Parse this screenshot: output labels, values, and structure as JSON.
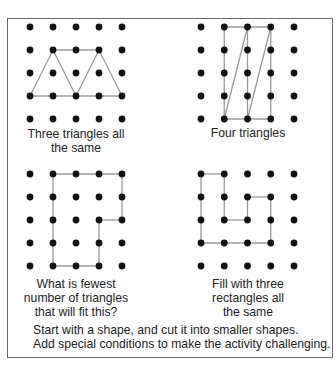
{
  "panels": [
    {
      "id": "three-triangles",
      "caption_lines": [
        "Three triangles all",
        "the same"
      ],
      "grid": {
        "origin_x": 30,
        "origin_y": 27,
        "step_x": 23,
        "step_y": 23,
        "cols": 5,
        "rows": 5
      },
      "segments": [
        [
          [
            0,
            3
          ],
          [
            4,
            3
          ]
        ],
        [
          [
            1,
            1
          ],
          [
            3,
            1
          ]
        ],
        [
          [
            0,
            3
          ],
          [
            1,
            1
          ]
        ],
        [
          [
            1,
            1
          ],
          [
            2,
            3
          ]
        ],
        [
          [
            2,
            3
          ],
          [
            3,
            1
          ]
        ],
        [
          [
            3,
            1
          ],
          [
            4,
            3
          ]
        ]
      ]
    },
    {
      "id": "four-triangles",
      "caption_lines": [
        "Four triangles"
      ],
      "grid": {
        "origin_x": 201,
        "origin_y": 27,
        "step_x": 23.25,
        "step_y": 23,
        "cols": 5,
        "rows": 5
      },
      "segments": [
        [
          [
            1,
            0
          ],
          [
            3,
            0
          ]
        ],
        [
          [
            1,
            4
          ],
          [
            3,
            4
          ]
        ],
        [
          [
            1,
            0
          ],
          [
            1,
            4
          ]
        ],
        [
          [
            2,
            0
          ],
          [
            2,
            4
          ]
        ],
        [
          [
            3,
            0
          ],
          [
            3,
            4
          ]
        ],
        [
          [
            1,
            4
          ],
          [
            2,
            0
          ]
        ],
        [
          [
            2,
            4
          ],
          [
            3,
            0
          ]
        ]
      ]
    },
    {
      "id": "fewest-triangles",
      "caption_lines": [
        "What is fewest",
        "number of triangles",
        "that will fit this?"
      ],
      "grid": {
        "origin_x": 30,
        "origin_y": 174,
        "step_x": 23,
        "step_y": 23,
        "cols": 5,
        "rows": 5
      },
      "segments": [
        [
          [
            1,
            0
          ],
          [
            4,
            0
          ]
        ],
        [
          [
            4,
            0
          ],
          [
            4,
            2
          ]
        ],
        [
          [
            4,
            2
          ],
          [
            3,
            2
          ]
        ],
        [
          [
            3,
            2
          ],
          [
            3,
            4
          ]
        ],
        [
          [
            3,
            4
          ],
          [
            1,
            4
          ]
        ],
        [
          [
            1,
            4
          ],
          [
            1,
            0
          ]
        ]
      ]
    },
    {
      "id": "three-rectangles",
      "caption_lines": [
        "Fill with three",
        "rectangles all",
        "the same"
      ],
      "grid": {
        "origin_x": 201,
        "origin_y": 174,
        "step_x": 23.25,
        "step_y": 23,
        "cols": 5,
        "rows": 5
      },
      "segments": [
        [
          [
            0,
            0
          ],
          [
            1,
            0
          ]
        ],
        [
          [
            1,
            0
          ],
          [
            1,
            2
          ]
        ],
        [
          [
            1,
            2
          ],
          [
            2,
            2
          ]
        ],
        [
          [
            2,
            2
          ],
          [
            2,
            1
          ]
        ],
        [
          [
            2,
            1
          ],
          [
            3,
            1
          ]
        ],
        [
          [
            3,
            1
          ],
          [
            3,
            3
          ]
        ],
        [
          [
            3,
            3
          ],
          [
            0,
            3
          ]
        ],
        [
          [
            0,
            3
          ],
          [
            0,
            0
          ]
        ]
      ]
    }
  ],
  "footer": {
    "lines": [
      "Start with a shape, and cut it into smaller shapes.",
      "Add special conditions to make the activity challenging."
    ]
  },
  "colors": {
    "dot": "#111111",
    "line": "#9a9a9a",
    "border": "#6b6b6b"
  }
}
